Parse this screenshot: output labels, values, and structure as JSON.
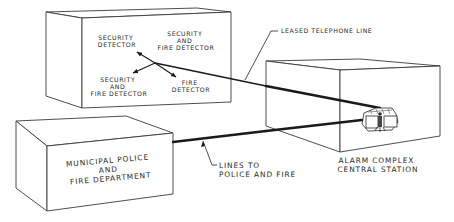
{
  "diagram": {
    "protected_premises": {
      "detectors": [
        {
          "label_lines": [
            "SECURITY",
            "DETECTOR"
          ]
        },
        {
          "label_lines": [
            "SECURITY",
            "AND",
            "FIRE DETECTOR"
          ]
        },
        {
          "label_lines": [
            "SECURITY",
            "AND",
            "FIRE DETECTOR"
          ]
        },
        {
          "label_lines": [
            "FIRE",
            "DETECTOR"
          ]
        }
      ]
    },
    "central_station": {
      "label_lines": [
        "ALARM COMPLEX",
        "CENTRAL STATION"
      ]
    },
    "municipal": {
      "label_lines": [
        "MUNICIPAL POLICE",
        "AND",
        "FIRE DEPARTMENT"
      ]
    },
    "connections": {
      "telephone_line_label": "LEASED TELEPHONE LINE",
      "police_fire_lines_label_lines": [
        "LINES TO",
        "POLICE AND FIRE"
      ]
    },
    "colors": {
      "line": "#1a1a1a",
      "background": "#ffffff"
    }
  }
}
